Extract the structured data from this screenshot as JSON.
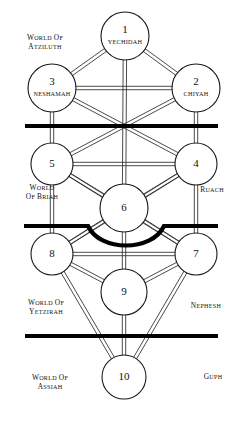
{
  "diagram": {
    "background_color": "#ffffff",
    "line_color": "#2b2b2b",
    "bar_color": "#000000",
    "circle_fill": "#ffffff",
    "circle_stroke": "#1a1a1a"
  },
  "sephiroth": [
    {
      "number": "1",
      "name": "Yechidah",
      "cx": 125,
      "cy": 36,
      "r": 24
    },
    {
      "number": "2",
      "name": "Chiyah",
      "cx": 196,
      "cy": 88,
      "r": 24
    },
    {
      "number": "3",
      "name": "Neshamah",
      "cx": 52,
      "cy": 88,
      "r": 24
    },
    {
      "number": "4",
      "name": "",
      "cx": 196,
      "cy": 164,
      "r": 21
    },
    {
      "number": "5",
      "name": "",
      "cx": 52,
      "cy": 164,
      "r": 21
    },
    {
      "number": "6",
      "name": "",
      "cx": 124,
      "cy": 208,
      "r": 24
    },
    {
      "number": "7",
      "name": "",
      "cx": 196,
      "cy": 254,
      "r": 21
    },
    {
      "number": "8",
      "name": "",
      "cx": 52,
      "cy": 254,
      "r": 21
    },
    {
      "number": "9",
      "name": "",
      "cx": 124,
      "cy": 292,
      "r": 23
    },
    {
      "number": "10",
      "name": "",
      "cx": 124,
      "cy": 377,
      "r": 22
    }
  ],
  "worlds": [
    {
      "id": "atziluth",
      "line1": "WORLD OF",
      "line2": "ATZILUTH",
      "x": 45,
      "y": 40,
      "side": "left"
    },
    {
      "id": "briah",
      "line1": "WORLD",
      "line2": "OF BRIAH",
      "x": 42,
      "y": 190,
      "side": "left"
    },
    {
      "id": "yetzirah",
      "line1": "WORLD OF",
      "line2": "YETZIRAH",
      "x": 46,
      "y": 305,
      "side": "left"
    },
    {
      "id": "assiah",
      "line1": "WORLD OF",
      "line2": "ASSIAH",
      "x": 50,
      "y": 380,
      "side": "left"
    }
  ],
  "souls": [
    {
      "id": "ruach",
      "label": "RUACH",
      "x": 212,
      "y": 192
    },
    {
      "id": "nephesh",
      "label": "NEPHESH",
      "x": 206,
      "y": 308
    },
    {
      "id": "guph",
      "label": "GUPH",
      "x": 213,
      "y": 379
    }
  ],
  "veils": [
    {
      "id": "veil-upper",
      "type": "straight",
      "x1": 25,
      "y1": 126,
      "x2": 218,
      "y2": 126,
      "width": 4.2
    },
    {
      "id": "veil-middle",
      "type": "curved",
      "d": "M 24 226 L 72 226 L 88 226 C 100 252 152 252 164 226 L 180 226 L 218 226",
      "width": 4.2
    },
    {
      "id": "veil-lower",
      "type": "straight",
      "x1": 25,
      "y1": 336,
      "x2": 218,
      "y2": 336,
      "width": 4.2
    }
  ],
  "paths": [
    {
      "from": "1",
      "to": "2"
    },
    {
      "from": "1",
      "to": "3"
    },
    {
      "from": "2",
      "to": "3"
    },
    {
      "from": "1",
      "to": "6"
    },
    {
      "from": "2",
      "to": "4"
    },
    {
      "from": "3",
      "to": "5"
    },
    {
      "from": "2",
      "to": "5"
    },
    {
      "from": "3",
      "to": "4"
    },
    {
      "from": "4",
      "to": "5"
    },
    {
      "from": "4",
      "to": "6"
    },
    {
      "from": "5",
      "to": "6"
    },
    {
      "from": "4",
      "to": "7"
    },
    {
      "from": "5",
      "to": "8"
    },
    {
      "from": "4",
      "to": "8"
    },
    {
      "from": "5",
      "to": "7"
    },
    {
      "from": "6",
      "to": "7"
    },
    {
      "from": "6",
      "to": "8"
    },
    {
      "from": "6",
      "to": "9"
    },
    {
      "from": "7",
      "to": "8"
    },
    {
      "from": "7",
      "to": "9"
    },
    {
      "from": "8",
      "to": "9"
    },
    {
      "from": "7",
      "to": "10"
    },
    {
      "from": "8",
      "to": "10"
    },
    {
      "from": "9",
      "to": "10"
    }
  ]
}
